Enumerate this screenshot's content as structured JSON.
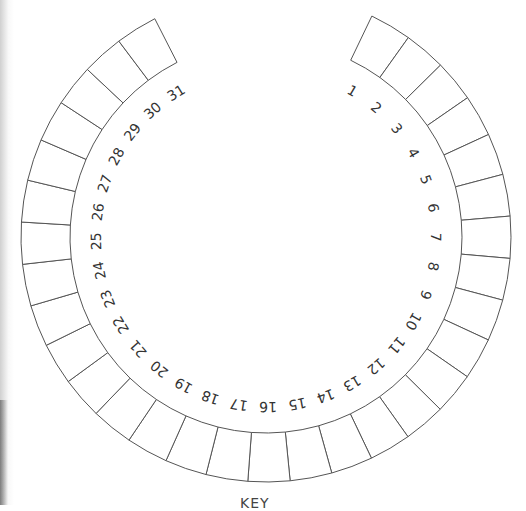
{
  "calendar_dial": {
    "days": [
      "1",
      "2",
      "3",
      "4",
      "5",
      "6",
      "7",
      "8",
      "9",
      "10",
      "11",
      "12",
      "13",
      "14",
      "15",
      "16",
      "17",
      "18",
      "19",
      "20",
      "21",
      "22",
      "23",
      "24",
      "25",
      "26",
      "27",
      "28",
      "29",
      "30",
      "31"
    ],
    "geometry": {
      "center_x": 266,
      "center_y": 237,
      "outer_radius": 245,
      "inner_radius": 196,
      "label_radius": 170,
      "start_angle_deg": 25.6,
      "end_angle_deg": 333,
      "direction": "clockwise"
    },
    "stroke_color": "#555555",
    "label_color": "#333333"
  },
  "bottom_caption": "KEY"
}
